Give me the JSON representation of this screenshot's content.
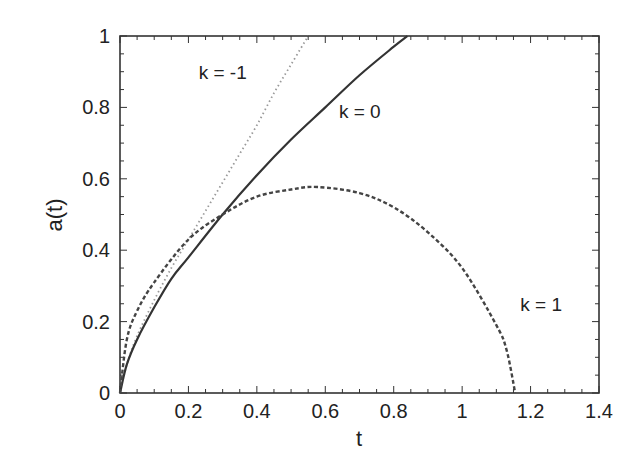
{
  "chart_data": {
    "type": "line",
    "title": "",
    "xlabel": "t",
    "ylabel": "a(t)",
    "xlim": [
      0,
      1.4
    ],
    "ylim": [
      0,
      1
    ],
    "grid": false,
    "legend": "none (inline annotations)",
    "x_ticks": [
      "0",
      "0.2",
      "0.4",
      "0.6",
      "0.8",
      "1",
      "1.2",
      "1.4"
    ],
    "y_ticks": [
      "0",
      "0.2",
      "0.4",
      "0.6",
      "0.8",
      "1"
    ],
    "series": [
      {
        "name": "k = -1",
        "style": "dotted",
        "color": "#999999",
        "x": [
          0,
          0.02,
          0.05,
          0.1,
          0.15,
          0.2,
          0.25,
          0.3,
          0.35,
          0.4,
          0.45,
          0.5,
          0.55
        ],
        "y": [
          0,
          0.08,
          0.16,
          0.26,
          0.35,
          0.43,
          0.51,
          0.59,
          0.67,
          0.75,
          0.84,
          0.92,
          1.0
        ]
      },
      {
        "name": "k = 0",
        "style": "solid",
        "color": "#333333",
        "x": [
          0,
          0.02,
          0.05,
          0.1,
          0.15,
          0.2,
          0.3,
          0.4,
          0.5,
          0.6,
          0.7,
          0.8,
          0.84
        ],
        "y": [
          0,
          0.08,
          0.15,
          0.24,
          0.32,
          0.38,
          0.5,
          0.61,
          0.71,
          0.8,
          0.89,
          0.97,
          1.0
        ]
      },
      {
        "name": "k = 1",
        "style": "dashed",
        "color": "#444444",
        "x": [
          0,
          0.02,
          0.05,
          0.1,
          0.2,
          0.3,
          0.4,
          0.5,
          0.577,
          0.7,
          0.8,
          0.9,
          1.0,
          1.1,
          1.13,
          1.155
        ],
        "y": [
          0,
          0.15,
          0.23,
          0.31,
          0.43,
          0.5,
          0.55,
          0.57,
          0.577,
          0.56,
          0.52,
          0.45,
          0.35,
          0.19,
          0.12,
          0
        ]
      }
    ],
    "annotations": [
      {
        "text": "k = -1",
        "x": 0.23,
        "y": 0.9
      },
      {
        "text": "k = 0",
        "x": 0.64,
        "y": 0.79
      },
      {
        "text": "k = 1",
        "x": 1.17,
        "y": 0.25
      }
    ]
  }
}
